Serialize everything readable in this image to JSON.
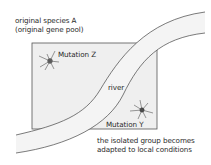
{
  "diagram": {
    "species_label_line1": "original species A",
    "species_label_line2": "(original gene pool)",
    "mutation_z_label": "Mutation Z",
    "mutation_y_label": "Mutation Y",
    "river_label": "river",
    "caption_line1": "the isolated group becomes",
    "caption_line2": "adapted to local conditions",
    "colors": {
      "region_fill": "#f0f0f0",
      "region_stroke": "#555555",
      "river_fill": "#f4f4f4",
      "river_stroke": "#444444",
      "text": "#2a2a2a"
    }
  }
}
